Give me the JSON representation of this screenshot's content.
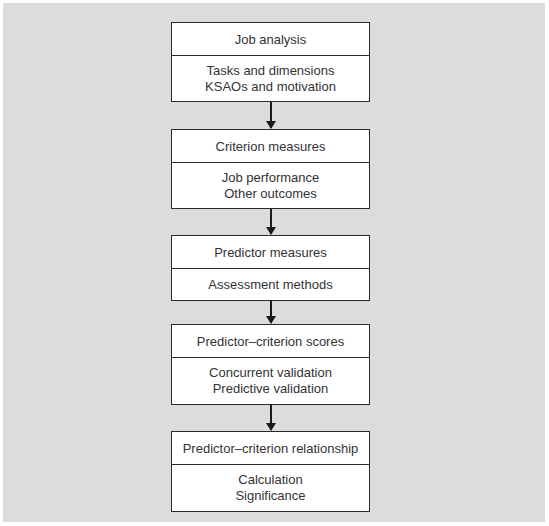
{
  "diagram": {
    "type": "flowchart",
    "direction": "top-to-bottom",
    "colors": {
      "background": "#dcdcdc",
      "box_fill": "#ffffff",
      "border": "#2a2a2a",
      "arrow": "#1a1a1a"
    },
    "steps": [
      {
        "title": "Job analysis",
        "items": [
          "Tasks and dimensions",
          "KSAOs and motivation"
        ]
      },
      {
        "title": "Criterion measures",
        "items": [
          "Job performance",
          "Other outcomes"
        ]
      },
      {
        "title": "Predictor measures",
        "items": [
          "Assessment methods"
        ]
      },
      {
        "title": "Predictor–criterion scores",
        "items": [
          "Concurrent validation",
          "Predictive validation"
        ]
      },
      {
        "title": "Predictor–criterion relationship",
        "items": [
          "Calculation",
          "Significance"
        ]
      }
    ]
  }
}
